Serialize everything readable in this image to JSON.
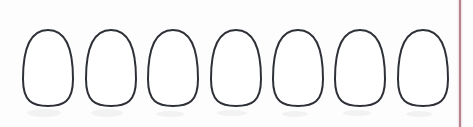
{
  "page": {
    "width": 473,
    "height": 127,
    "background_color": "#fdfdfd"
  },
  "figure": {
    "name": "egg-outline-row",
    "shape_count": 7,
    "shape_label": "egg-outline",
    "stroke_color": "#2e3038",
    "fill_color": "#ffffff",
    "stroke_width": 2,
    "eggs": [
      {
        "index": 1,
        "label": "egg-1",
        "center_x": 48,
        "center_y": 68,
        "width": 50,
        "height": 76,
        "top_y": 27,
        "bottom_y": 103
      },
      {
        "index": 2,
        "label": "egg-2",
        "center_x": 111,
        "center_y": 68,
        "width": 50,
        "height": 76,
        "top_y": 27,
        "bottom_y": 103
      },
      {
        "index": 3,
        "label": "egg-3",
        "center_x": 173,
        "center_y": 68,
        "width": 50,
        "height": 76,
        "top_y": 27,
        "bottom_y": 103
      },
      {
        "index": 4,
        "label": "egg-4",
        "center_x": 236,
        "center_y": 68,
        "width": 50,
        "height": 76,
        "top_y": 27,
        "bottom_y": 103
      },
      {
        "index": 5,
        "label": "egg-5",
        "center_x": 298,
        "center_y": 68,
        "width": 50,
        "height": 76,
        "top_y": 27,
        "bottom_y": 103
      },
      {
        "index": 6,
        "label": "egg-6",
        "center_x": 360,
        "center_y": 68,
        "width": 50,
        "height": 76,
        "top_y": 27,
        "bottom_y": 103
      },
      {
        "index": 7,
        "label": "egg-7",
        "center_x": 423,
        "center_y": 68,
        "width": 50,
        "height": 76,
        "top_y": 27,
        "bottom_y": 103
      }
    ]
  },
  "margin_rule": {
    "name": "vertical-margin-rule",
    "color": "#b5848f",
    "halo_color": "#d9b6bd",
    "x": 460,
    "y_start": 0,
    "y_end": 127,
    "orientation": "vertical"
  },
  "smudges": {
    "name": "paper-smudges",
    "color": "#9a9aa4",
    "opacity": 0.11,
    "marks": [
      {
        "x": 44,
        "y": 113,
        "rx": 17,
        "ry": 4
      },
      {
        "x": 107,
        "y": 113,
        "rx": 16,
        "ry": 4
      },
      {
        "x": 170,
        "y": 114,
        "rx": 14,
        "ry": 3
      },
      {
        "x": 232,
        "y": 113,
        "rx": 15,
        "ry": 3
      },
      {
        "x": 295,
        "y": 114,
        "rx": 13,
        "ry": 3
      },
      {
        "x": 357,
        "y": 113,
        "rx": 14,
        "ry": 3
      },
      {
        "x": 419,
        "y": 114,
        "rx": 13,
        "ry": 3
      }
    ]
  }
}
